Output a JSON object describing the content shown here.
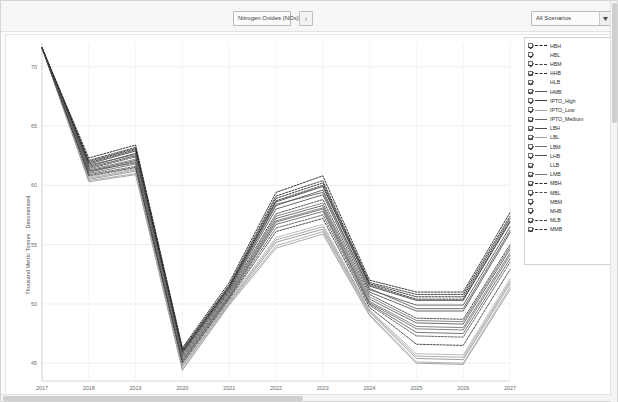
{
  "toolbar": {
    "pollutant_selector": {
      "value": "Nitrogen Oxides (NOx)",
      "arrow": "chevron-down-icon"
    },
    "info_button_label": "i",
    "scenario_selector": {
      "value": "All Scenarios",
      "arrow": "chevron-down-icon"
    }
  },
  "chart_data": {
    "type": "line",
    "title": "",
    "xlabel": "",
    "ylabel": "Thousand  Metric  Tonnes :  Denominated",
    "x": [
      2017,
      2018,
      2019,
      2020,
      2021,
      2022,
      2023,
      2024,
      2025,
      2026,
      2027
    ],
    "xtick_labels": [
      "2017",
      "2018",
      "2019",
      "2020",
      "2021",
      "2022",
      "2023",
      "2024",
      "2025",
      "2026",
      "2027"
    ],
    "ytick_labels": [
      "45",
      "50",
      "55",
      "60",
      "65",
      "70"
    ],
    "yticks": [
      45,
      50,
      55,
      60,
      65,
      70
    ],
    "ylim": [
      43.5,
      72.0
    ],
    "xlim": [
      2017,
      2027
    ],
    "grid": true,
    "legend_position": "right",
    "series": [
      {
        "name": "HBH",
        "style": "dashed",
        "color": "#1a1a1a",
        "values": [
          71.6,
          62.3,
          63.4,
          46.3,
          51.8,
          59.4,
          60.8,
          52.0,
          51.0,
          51.0,
          57.7
        ]
      },
      {
        "name": "HBL",
        "style": "solid",
        "color": "#9a9a9a",
        "values": [
          71.6,
          60.3,
          60.9,
          44.4,
          49.9,
          54.7,
          55.9,
          49.0,
          45.0,
          44.9,
          51.2
        ]
      },
      {
        "name": "HBM",
        "style": "dashed",
        "color": "#3a3a3a",
        "values": [
          71.6,
          61.4,
          62.4,
          45.7,
          51.0,
          57.6,
          58.8,
          50.8,
          48.8,
          48.7,
          55.0
        ]
      },
      {
        "name": "HHB",
        "style": "dashed",
        "color": "#262626",
        "values": [
          71.6,
          62.1,
          63.2,
          46.2,
          51.6,
          59.1,
          60.4,
          51.8,
          50.8,
          50.8,
          57.4
        ]
      },
      {
        "name": "HLB",
        "style": "solid",
        "color": "#8d8d8d",
        "values": [
          71.6,
          60.5,
          61.2,
          44.7,
          50.1,
          55.2,
          56.3,
          49.3,
          45.4,
          45.3,
          51.7
        ]
      },
      {
        "name": "HMB",
        "style": "solid",
        "color": "#545454",
        "values": [
          71.6,
          61.2,
          62.1,
          45.5,
          50.8,
          57.2,
          58.3,
          50.4,
          48.4,
          48.3,
          54.6
        ]
      },
      {
        "name": "IPTO_High",
        "style": "solid",
        "color": "#3f3f3f",
        "values": [
          71.6,
          61.8,
          62.9,
          46.0,
          51.4,
          58.6,
          59.9,
          51.5,
          50.3,
          50.3,
          56.9
        ]
      },
      {
        "name": "IPTO_Low",
        "style": "solid",
        "color": "#a4a4a4",
        "values": [
          71.6,
          60.4,
          61.0,
          44.5,
          50.0,
          54.9,
          56.1,
          49.1,
          45.1,
          45.0,
          51.4
        ]
      },
      {
        "name": "IPTO_Medium",
        "style": "solid",
        "color": "#6a6a6a",
        "values": [
          71.6,
          61.0,
          61.8,
          45.3,
          50.6,
          56.9,
          58.0,
          50.1,
          47.9,
          47.8,
          54.1
        ]
      },
      {
        "name": "LBH",
        "style": "solid",
        "color": "#4b4b4b",
        "values": [
          71.6,
          61.6,
          62.7,
          45.9,
          51.2,
          58.3,
          59.6,
          51.2,
          49.9,
          49.9,
          56.5
        ]
      },
      {
        "name": "LBL",
        "style": "solid",
        "color": "#9e9e9e",
        "values": [
          71.6,
          60.6,
          61.3,
          44.8,
          50.2,
          55.4,
          56.5,
          49.4,
          45.6,
          45.5,
          51.9
        ]
      },
      {
        "name": "LBM",
        "style": "solid",
        "color": "#707070",
        "values": [
          71.6,
          61.1,
          62.0,
          45.4,
          50.7,
          57.0,
          58.1,
          50.2,
          48.1,
          48.0,
          54.3
        ]
      },
      {
        "name": "LHB",
        "style": "solid",
        "color": "#4f4f4f",
        "values": [
          71.6,
          61.5,
          62.5,
          45.8,
          51.1,
          58.0,
          59.2,
          51.0,
          49.4,
          49.4,
          56.0
        ]
      },
      {
        "name": "LLB",
        "style": "solid",
        "color": "#b0b0b0",
        "values": [
          71.6,
          60.7,
          61.4,
          44.9,
          50.3,
          55.6,
          56.7,
          49.5,
          45.8,
          45.7,
          52.1
        ]
      },
      {
        "name": "LMB",
        "style": "solid",
        "color": "#757575",
        "values": [
          71.6,
          61.3,
          62.2,
          45.6,
          50.9,
          57.4,
          58.5,
          50.6,
          48.6,
          48.5,
          54.8
        ]
      },
      {
        "name": "MBH",
        "style": "dashed",
        "color": "#202020",
        "values": [
          71.6,
          62.0,
          63.1,
          46.1,
          51.5,
          58.9,
          60.2,
          51.7,
          50.6,
          50.6,
          57.2
        ]
      },
      {
        "name": "MBL",
        "style": "dashed",
        "color": "#4a4a4a",
        "values": [
          71.6,
          60.9,
          61.6,
          45.1,
          50.5,
          56.4,
          57.5,
          49.9,
          47.3,
          47.2,
          53.5
        ]
      },
      {
        "name": "MBM",
        "style": "solid",
        "color": "#606060",
        "values": [
          71.6,
          61.2,
          61.9,
          45.2,
          50.6,
          56.7,
          57.8,
          50.0,
          47.6,
          47.5,
          53.8
        ]
      },
      {
        "name": "MHB",
        "style": "solid",
        "color": "#5a5a5a",
        "values": [
          71.6,
          61.7,
          62.6,
          45.9,
          51.3,
          58.4,
          59.4,
          51.3,
          49.6,
          49.6,
          56.2
        ]
      },
      {
        "name": "MLB",
        "style": "dashed",
        "color": "#333333",
        "values": [
          71.6,
          60.8,
          61.5,
          45.0,
          50.4,
          56.1,
          57.2,
          49.7,
          46.6,
          46.5,
          52.9
        ]
      },
      {
        "name": "MMB",
        "style": "dashed",
        "color": "#2b2b2b",
        "values": [
          71.6,
          61.9,
          63.0,
          46.0,
          51.4,
          58.7,
          60.0,
          51.6,
          50.4,
          50.4,
          57.0
        ]
      }
    ]
  },
  "legend": {
    "items": [
      {
        "label": "HBH",
        "checked": true,
        "style": "dashed",
        "color": "#1a1a1a"
      },
      {
        "label": "HBL",
        "checked": true,
        "style": "none",
        "color": "#c8c8c8"
      },
      {
        "label": "HBM",
        "checked": true,
        "style": "dashed",
        "color": "#3a3a3a"
      },
      {
        "label": "HHB",
        "checked": true,
        "style": "dashed",
        "color": "#262626"
      },
      {
        "label": "HLB",
        "checked": true,
        "style": "none",
        "color": "#c8c8c8"
      },
      {
        "label": "HMB",
        "checked": true,
        "style": "solid",
        "color": "#545454"
      },
      {
        "label": "IPTO_High",
        "checked": true,
        "style": "solid",
        "color": "#3f3f3f"
      },
      {
        "label": "IPTO_Low",
        "checked": true,
        "style": "solid",
        "color": "#a4a4a4"
      },
      {
        "label": "IPTO_Medium",
        "checked": true,
        "style": "solid",
        "color": "#6a6a6a"
      },
      {
        "label": "LBH",
        "checked": true,
        "style": "solid",
        "color": "#4b4b4b"
      },
      {
        "label": "LBL",
        "checked": true,
        "style": "solid",
        "color": "#9e9e9e"
      },
      {
        "label": "LBM",
        "checked": true,
        "style": "solid",
        "color": "#707070"
      },
      {
        "label": "LHB",
        "checked": true,
        "style": "solid",
        "color": "#4f4f4f"
      },
      {
        "label": "LLB",
        "checked": true,
        "style": "none",
        "color": "#c8c8c8"
      },
      {
        "label": "LMB",
        "checked": true,
        "style": "solid",
        "color": "#757575"
      },
      {
        "label": "MBH",
        "checked": true,
        "style": "dashed",
        "color": "#202020"
      },
      {
        "label": "MBL",
        "checked": true,
        "style": "dashed",
        "color": "#4a4a4a"
      },
      {
        "label": "MBM",
        "checked": true,
        "style": "none",
        "color": "#c8c8c8"
      },
      {
        "label": "MHB",
        "checked": true,
        "style": "none",
        "color": "#c8c8c8"
      },
      {
        "label": "MLB",
        "checked": true,
        "style": "dashed",
        "color": "#333333"
      },
      {
        "label": "MMB",
        "checked": true,
        "style": "dashed",
        "color": "#2b2b2b"
      }
    ]
  }
}
